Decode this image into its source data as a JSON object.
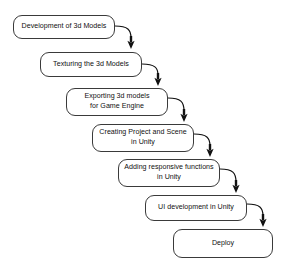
{
  "diagram": {
    "type": "waterfall-flowchart",
    "background_color": "#ffffff",
    "box_border_color": "#3a3a3a",
    "box_fill_color": "#ffffff",
    "arrow_color": "#111111",
    "text_color": "#111111",
    "nodes": [
      {
        "id": "development-of-3d-models",
        "label": "Development of 3d Models",
        "x": 13,
        "y": 15,
        "width": 102,
        "height": 24
      },
      {
        "id": "texturing-the-3d-models",
        "label": "Texturing the 3d Models",
        "x": 40,
        "y": 52,
        "width": 102,
        "height": 25
      },
      {
        "id": "exporting-3d-models-for-game-engine",
        "label": "Exporting 3d models\nfor Game Engine",
        "x": 66,
        "y": 88,
        "width": 102,
        "height": 28
      },
      {
        "id": "creating-project-and-scene-in-unity",
        "label": "Creating Project and Scene\nin Unity",
        "x": 92,
        "y": 124,
        "width": 102,
        "height": 28
      },
      {
        "id": "adding-responsive-functions-in-unity",
        "label": "Adding responsive functions\nin Unity",
        "x": 118,
        "y": 159,
        "width": 102,
        "height": 28
      },
      {
        "id": "ui-development-in-unity",
        "label": "UI development in Unity",
        "x": 145,
        "y": 195,
        "width": 102,
        "height": 26
      },
      {
        "id": "deploy",
        "label": "Deploy",
        "x": 173,
        "y": 229,
        "width": 100,
        "height": 29
      }
    ],
    "connectors": [
      {
        "id": "arrow-1",
        "from": "development-of-3d-models",
        "to": "texturing-the-3d-models",
        "path": "M 115 26 C 128 26 131 30 131 38",
        "arrow_tip_x": 131,
        "arrow_tip_y": 49
      },
      {
        "id": "arrow-2",
        "from": "texturing-the-3d-models",
        "to": "exporting-3d-models-for-game-engine",
        "path": "M 142 64 C 155 64 158 68 158 75",
        "arrow_tip_x": 158,
        "arrow_tip_y": 86
      },
      {
        "id": "arrow-3",
        "from": "exporting-3d-models-for-game-engine",
        "to": "creating-project-and-scene-in-unity",
        "path": "M 168 98 C 181 98 184 102 184 111",
        "arrow_tip_x": 184,
        "arrow_tip_y": 122
      },
      {
        "id": "arrow-4",
        "from": "creating-project-and-scene-in-unity",
        "to": "adding-responsive-functions-in-unity",
        "path": "M 194 134 C 207 134 210 138 210 146",
        "arrow_tip_x": 210,
        "arrow_tip_y": 157
      },
      {
        "id": "arrow-5",
        "from": "adding-responsive-functions-in-unity",
        "to": "ui-development-in-unity",
        "path": "M 220 169 C 233 169 236 173 236 182",
        "arrow_tip_x": 236,
        "arrow_tip_y": 193
      },
      {
        "id": "arrow-6",
        "from": "ui-development-in-unity",
        "to": "deploy",
        "path": "M 247 204 C 260 204 263 208 263 216",
        "arrow_tip_x": 263,
        "arrow_tip_y": 227
      }
    ]
  }
}
